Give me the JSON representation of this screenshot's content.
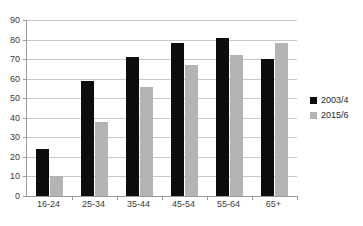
{
  "chart_data": {
    "type": "bar",
    "title": "",
    "xlabel": "",
    "ylabel": "",
    "ylim": [
      0,
      90
    ],
    "ytick_step": 10,
    "yticks": [
      "90",
      "80",
      "70",
      "60",
      "50",
      "40",
      "30",
      "20",
      "10",
      "0"
    ],
    "grid": true,
    "legend_position": "right",
    "categories": [
      "16-24",
      "25-34",
      "35-44",
      "45-54",
      "55-64",
      "65+"
    ],
    "series": [
      {
        "name": "2003/4",
        "color": "#0d0d0d",
        "values": [
          24,
          59,
          71,
          78,
          81,
          70
        ]
      },
      {
        "name": "2015/6",
        "color": "#b4b4b4",
        "values": [
          10,
          38,
          56,
          67,
          72,
          78
        ]
      }
    ]
  },
  "legend": {
    "items": [
      {
        "label": "2003/4",
        "swatch": "legend-swatch-black"
      },
      {
        "label": "2015/6",
        "swatch": "legend-swatch-gray"
      }
    ]
  }
}
